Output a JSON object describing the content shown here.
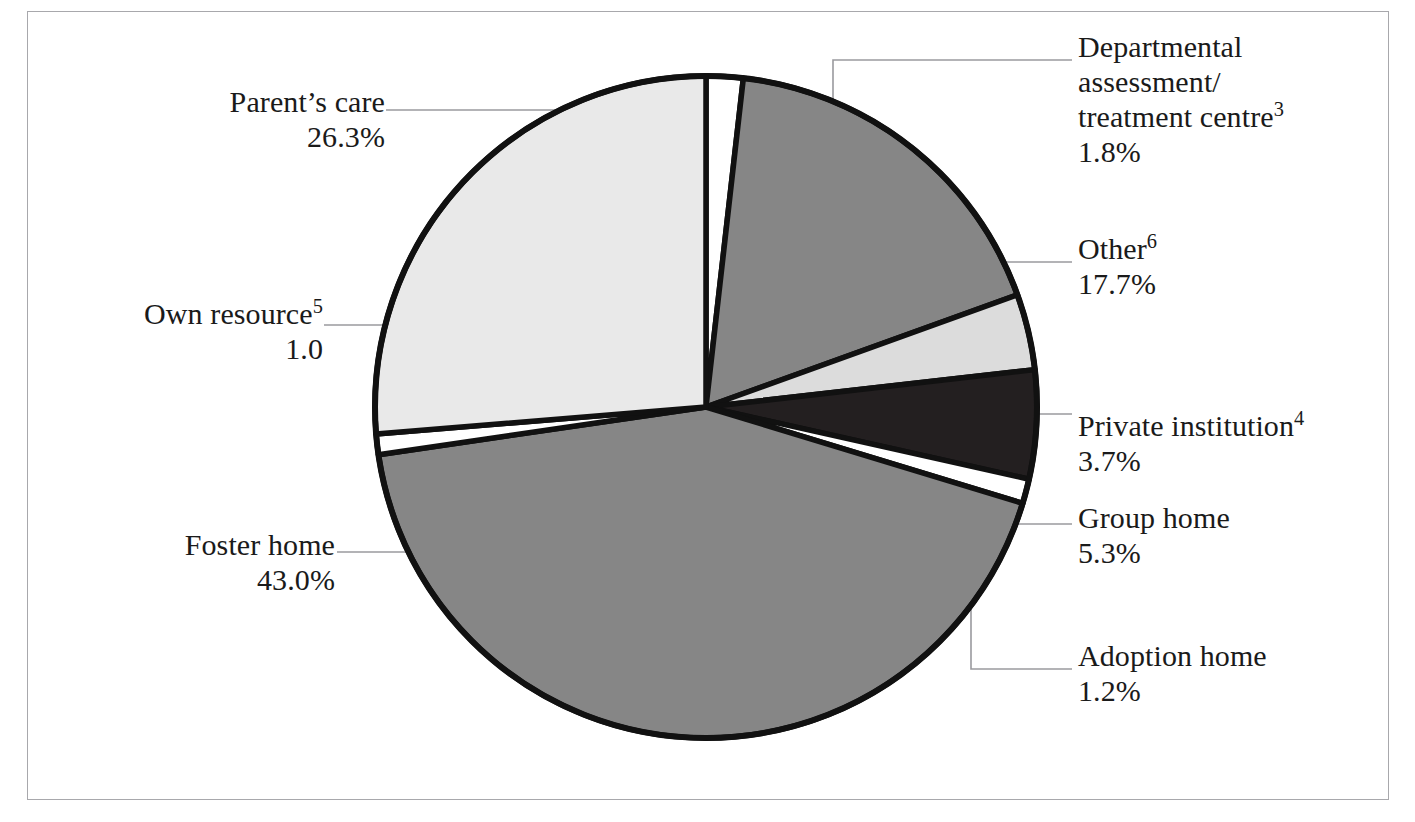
{
  "figure": {
    "background_color": "#ffffff",
    "frame_color": "#a8a8ac",
    "slice_stroke_color": "#111111"
  },
  "chart_data": {
    "type": "pie",
    "title": "",
    "subtitle": "",
    "xlabel": "",
    "ylabel": "",
    "legend_position": "callout-labels",
    "grid": false,
    "start_angle_deg": 0,
    "direction": "clockwise",
    "categories": [
      "Departmental assessment/treatment centre",
      "Other",
      "Private institution",
      "Group home",
      "Adoption home",
      "Foster home",
      "Own resource",
      "Parent's care"
    ],
    "values": [
      1.8,
      17.7,
      3.7,
      5.3,
      1.2,
      43.0,
      1.0,
      26.3
    ],
    "value_labels": [
      "1.8%",
      "17.7%",
      "3.7%",
      "5.3%",
      "1.2%",
      "43.0%",
      "1.0",
      "26.3%"
    ],
    "slice_colors": [
      "#ffffff",
      "#868686",
      "#dcdcdc",
      "#231f20",
      "#ffffff",
      "#868686",
      "#ffffff",
      "#e9e9e9"
    ],
    "slices": [
      {
        "name": "departmental-assessment-treatment-centre",
        "label_line1": "Departmental",
        "label_line2": "assessment/",
        "label_line3": "treatment centre",
        "footnote": "3",
        "value_label": "1.8%",
        "value": 1.8,
        "color": "#ffffff"
      },
      {
        "name": "other",
        "label_line1": "Other",
        "footnote": "6",
        "value_label": "17.7%",
        "value": 17.7,
        "color": "#868686"
      },
      {
        "name": "private-institution",
        "label_line1": "Private institution",
        "footnote": "4",
        "value_label": "3.7%",
        "value": 3.7,
        "color": "#dcdcdc"
      },
      {
        "name": "group-home",
        "label_line1": "Group home",
        "footnote": "",
        "value_label": "5.3%",
        "value": 5.3,
        "color": "#231f20"
      },
      {
        "name": "adoption-home",
        "label_line1": "Adoption home",
        "footnote": "",
        "value_label": "1.2%",
        "value": 1.2,
        "color": "#ffffff"
      },
      {
        "name": "foster-home",
        "label_line1": "Foster home",
        "footnote": "",
        "value_label": "43.0%",
        "value": 43.0,
        "color": "#868686"
      },
      {
        "name": "own-resource",
        "label_line1": "Own resource",
        "footnote": "5",
        "value_label": "1.0",
        "value": 1.0,
        "color": "#ffffff"
      },
      {
        "name": "parents-care",
        "label_line1": "Parent’s care",
        "footnote": "",
        "value_label": "26.3%",
        "value": 26.3,
        "color": "#e9e9e9"
      }
    ]
  }
}
